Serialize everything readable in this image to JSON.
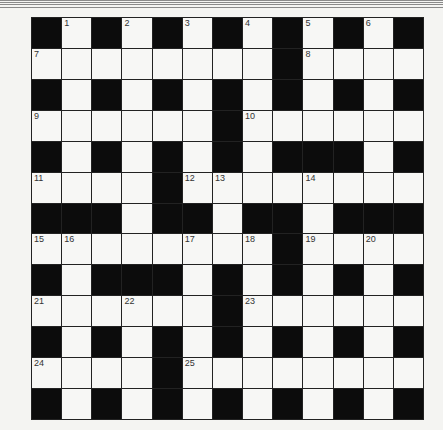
{
  "puzzle": {
    "type": "crossword",
    "rows": 13,
    "cols": 13,
    "colors": {
      "black": "#0c0c0c",
      "white": "#f7f7f5",
      "lines": "#222222"
    },
    "grid": [
      "#.#.#.#.#.#.#",
      "........#....",
      "#.#.#.#.#.#.#",
      "......#......",
      "#.#.#.#.###.#",
      "....#........",
      "###.##.##.###",
      "........#....",
      "#.###.#.#.#.#",
      "......#......",
      "#.#.#.#.#.#.#",
      "....#........",
      "#.#.#.#.#.#.#"
    ],
    "numbers": [
      {
        "r": 0,
        "c": 1,
        "n": "1"
      },
      {
        "r": 0,
        "c": 3,
        "n": "2"
      },
      {
        "r": 0,
        "c": 5,
        "n": "3"
      },
      {
        "r": 0,
        "c": 7,
        "n": "4"
      },
      {
        "r": 0,
        "c": 9,
        "n": "5"
      },
      {
        "r": 0,
        "c": 11,
        "n": "6"
      },
      {
        "r": 1,
        "c": 0,
        "n": "7"
      },
      {
        "r": 1,
        "c": 9,
        "n": "8"
      },
      {
        "r": 3,
        "c": 0,
        "n": "9"
      },
      {
        "r": 3,
        "c": 7,
        "n": "10"
      },
      {
        "r": 5,
        "c": 0,
        "n": "11"
      },
      {
        "r": 5,
        "c": 5,
        "n": "12"
      },
      {
        "r": 5,
        "c": 6,
        "n": "13"
      },
      {
        "r": 5,
        "c": 9,
        "n": "14"
      },
      {
        "r": 7,
        "c": 0,
        "n": "15"
      },
      {
        "r": 7,
        "c": 1,
        "n": "16"
      },
      {
        "r": 7,
        "c": 5,
        "n": "17"
      },
      {
        "r": 7,
        "c": 7,
        "n": "18"
      },
      {
        "r": 7,
        "c": 9,
        "n": "19"
      },
      {
        "r": 7,
        "c": 11,
        "n": "20"
      },
      {
        "r": 9,
        "c": 0,
        "n": "21"
      },
      {
        "r": 9,
        "c": 3,
        "n": "22"
      },
      {
        "r": 9,
        "c": 7,
        "n": "23"
      },
      {
        "r": 11,
        "c": 0,
        "n": "24"
      },
      {
        "r": 11,
        "c": 5,
        "n": "25"
      }
    ]
  }
}
